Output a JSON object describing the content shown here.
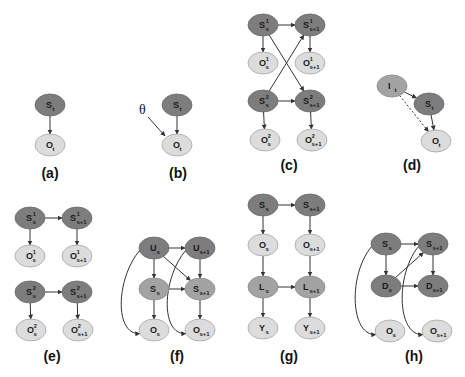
{
  "figure": {
    "panels": [
      {
        "id": "a",
        "label": "(a)",
        "nodes": [
          {
            "name": "S",
            "sub": "t",
            "sup": "",
            "shade": "dark",
            "x": 50,
            "y": 105
          },
          {
            "name": "O",
            "sub": "t",
            "sup": "",
            "shade": "light",
            "x": 50,
            "y": 145
          }
        ],
        "edges": [
          {
            "from": 0,
            "to": 1,
            "style": "solid"
          }
        ],
        "label_pos": [
          50,
          178
        ]
      },
      {
        "id": "b",
        "label": "(b)",
        "extra_symbol": "θ",
        "nodes": [
          {
            "name": "S",
            "sub": "t",
            "sup": "",
            "shade": "dark",
            "x": 177,
            "y": 105
          },
          {
            "name": "O",
            "sub": "t",
            "sup": "",
            "shade": "light",
            "x": 177,
            "y": 145
          }
        ],
        "edges": [
          {
            "from": 0,
            "to": 1,
            "style": "solid"
          }
        ],
        "label_pos": [
          178,
          178
        ]
      },
      {
        "id": "c",
        "label": "(c)",
        "nodes": [
          {
            "name": "S",
            "sub": "s",
            "sup": "1",
            "shade": "dark",
            "x": 263,
            "y": 25
          },
          {
            "name": "S",
            "sub": "s+1",
            "sup": "1",
            "shade": "dark",
            "x": 310,
            "y": 25
          },
          {
            "name": "O",
            "sub": "s",
            "sup": "1",
            "shade": "light",
            "x": 263,
            "y": 63
          },
          {
            "name": "O",
            "sub": "s+1",
            "sup": "1",
            "shade": "light",
            "x": 310,
            "y": 63
          },
          {
            "name": "S",
            "sub": "s",
            "sup": "2",
            "shade": "dark",
            "x": 263,
            "y": 101
          },
          {
            "name": "S",
            "sub": "s+1",
            "sup": "2",
            "shade": "dark",
            "x": 310,
            "y": 101
          },
          {
            "name": "O",
            "sub": "s",
            "sup": "2",
            "shade": "light",
            "x": 265,
            "y": 140
          },
          {
            "name": "O",
            "sub": "s+1",
            "sup": "2",
            "shade": "light",
            "x": 312,
            "y": 140
          }
        ],
        "edges": [
          {
            "from": 0,
            "to": 1,
            "style": "solid"
          },
          {
            "from": 0,
            "to": 2,
            "style": "solid"
          },
          {
            "from": 1,
            "to": 3,
            "style": "solid"
          },
          {
            "from": 0,
            "to": 5,
            "style": "solid"
          },
          {
            "from": 4,
            "to": 1,
            "style": "solid"
          },
          {
            "from": 4,
            "to": 5,
            "style": "solid"
          },
          {
            "from": 4,
            "to": 6,
            "style": "solid"
          },
          {
            "from": 5,
            "to": 7,
            "style": "solid"
          }
        ],
        "label_pos": [
          289,
          170
        ]
      },
      {
        "id": "d",
        "label": "(d)",
        "nodes": [
          {
            "name": "I",
            "sub": "t",
            "sup": "",
            "shade": "mid",
            "x": 392,
            "y": 86
          },
          {
            "name": "S",
            "sub": "t",
            "sup": "",
            "shade": "dark",
            "x": 429,
            "y": 104
          },
          {
            "name": "O",
            "sub": "t",
            "sup": "",
            "shade": "light",
            "x": 436,
            "y": 141
          }
        ],
        "edges": [
          {
            "from": 0,
            "to": 1,
            "style": "solid"
          },
          {
            "from": 1,
            "to": 2,
            "style": "solid"
          },
          {
            "from": 0,
            "to": 2,
            "style": "dashed"
          }
        ],
        "label_pos": [
          412,
          170
        ]
      },
      {
        "id": "e",
        "label": "(e)",
        "nodes": [
          {
            "name": "S",
            "sub": "s",
            "sup": "1",
            "shade": "dark",
            "x": 30,
            "y": 218
          },
          {
            "name": "S",
            "sub": "s+1",
            "sup": "1",
            "shade": "dark",
            "x": 77,
            "y": 218
          },
          {
            "name": "O",
            "sub": "s",
            "sup": "1",
            "shade": "light",
            "x": 30,
            "y": 256
          },
          {
            "name": "O",
            "sub": "s+1",
            "sup": "1",
            "shade": "light",
            "x": 77,
            "y": 256
          },
          {
            "name": "S",
            "sub": "s",
            "sup": "2",
            "shade": "dark",
            "x": 30,
            "y": 292
          },
          {
            "name": "S",
            "sub": "s+1",
            "sup": "2",
            "shade": "dark",
            "x": 77,
            "y": 292
          },
          {
            "name": "O",
            "sub": "s",
            "sup": "2",
            "shade": "light",
            "x": 31,
            "y": 330
          },
          {
            "name": "O",
            "sub": "s+1",
            "sup": "2",
            "shade": "light",
            "x": 78,
            "y": 330
          }
        ],
        "edges": [
          {
            "from": 0,
            "to": 1,
            "style": "solid"
          },
          {
            "from": 0,
            "to": 2,
            "style": "solid"
          },
          {
            "from": 1,
            "to": 3,
            "style": "solid"
          },
          {
            "from": 4,
            "to": 5,
            "style": "solid"
          },
          {
            "from": 4,
            "to": 6,
            "style": "solid"
          },
          {
            "from": 5,
            "to": 7,
            "style": "solid"
          }
        ],
        "label_pos": [
          52,
          361
        ]
      },
      {
        "id": "f",
        "label": "(f)",
        "nodes": [
          {
            "name": "U",
            "sub": "s",
            "sup": "",
            "shade": "dark",
            "x": 154,
            "y": 248
          },
          {
            "name": "U",
            "sub": "s+1",
            "sup": "",
            "shade": "dark",
            "x": 200,
            "y": 248
          },
          {
            "name": "S",
            "sub": "s",
            "sup": "",
            "shade": "mid",
            "x": 154,
            "y": 289
          },
          {
            "name": "S",
            "sub": "s+1",
            "sup": "",
            "shade": "mid",
            "x": 200,
            "y": 289
          },
          {
            "name": "O",
            "sub": "s",
            "sup": "",
            "shade": "light",
            "x": 154,
            "y": 330
          },
          {
            "name": "O",
            "sub": "s+1",
            "sup": "",
            "shade": "light",
            "x": 200,
            "y": 330
          }
        ],
        "edges": [
          {
            "from": 0,
            "to": 1,
            "style": "solid"
          },
          {
            "from": 0,
            "to": 2,
            "style": "solid"
          },
          {
            "from": 1,
            "to": 3,
            "style": "solid"
          },
          {
            "from": 0,
            "to": 3,
            "style": "solid"
          },
          {
            "from": 2,
            "to": 3,
            "style": "solid"
          },
          {
            "from": 2,
            "to": 4,
            "style": "solid"
          },
          {
            "from": 3,
            "to": 5,
            "style": "solid"
          },
          {
            "from": 0,
            "to": 4,
            "style": "curved-left"
          },
          {
            "from": 1,
            "to": 5,
            "style": "curved-left"
          }
        ],
        "label_pos": [
          177,
          361
        ]
      },
      {
        "id": "g",
        "label": "(g)",
        "nodes": [
          {
            "name": "S",
            "sub": "s",
            "sup": "",
            "shade": "dark",
            "x": 263,
            "y": 205
          },
          {
            "name": "S",
            "sub": "s+1",
            "sup": "",
            "shade": "dark",
            "x": 310,
            "y": 205
          },
          {
            "name": "O",
            "sub": "s",
            "sup": "",
            "shade": "light",
            "x": 263,
            "y": 245
          },
          {
            "name": "O",
            "sub": "s+1",
            "sup": "",
            "shade": "light",
            "x": 310,
            "y": 245
          },
          {
            "name": "L",
            "sub": "s",
            "sup": "",
            "shade": "mid",
            "x": 263,
            "y": 287
          },
          {
            "name": "L",
            "sub": "s+1",
            "sup": "",
            "shade": "mid",
            "x": 310,
            "y": 287
          },
          {
            "name": "Y",
            "sub": "s",
            "sup": "",
            "shade": "light",
            "x": 263,
            "y": 328
          },
          {
            "name": "Y",
            "sub": "s+1",
            "sup": "",
            "shade": "light",
            "x": 310,
            "y": 328
          }
        ],
        "edges": [
          {
            "from": 0,
            "to": 1,
            "style": "solid"
          },
          {
            "from": 0,
            "to": 2,
            "style": "solid"
          },
          {
            "from": 1,
            "to": 3,
            "style": "solid"
          },
          {
            "from": 2,
            "to": 4,
            "style": "solid"
          },
          {
            "from": 3,
            "to": 5,
            "style": "solid"
          },
          {
            "from": 4,
            "to": 5,
            "style": "solid"
          },
          {
            "from": 4,
            "to": 6,
            "style": "solid"
          },
          {
            "from": 5,
            "to": 7,
            "style": "solid"
          }
        ],
        "label_pos": [
          289,
          361
        ]
      },
      {
        "id": "h",
        "label": "(h)",
        "nodes": [
          {
            "name": "S",
            "sub": "s",
            "sup": "",
            "shade": "dark",
            "x": 386,
            "y": 244
          },
          {
            "name": "S",
            "sub": "s+1",
            "sup": "",
            "shade": "dark",
            "x": 433,
            "y": 244
          },
          {
            "name": "D",
            "sub": "s",
            "sup": "",
            "shade": "dark",
            "x": 386,
            "y": 286
          },
          {
            "name": "D",
            "sub": "s+1",
            "sup": "",
            "shade": "dark",
            "x": 433,
            "y": 286
          },
          {
            "name": "O",
            "sub": "s",
            "sup": "",
            "shade": "light",
            "x": 390,
            "y": 331
          },
          {
            "name": "O",
            "sub": "s+1",
            "sup": "",
            "shade": "light",
            "x": 437,
            "y": 331
          }
        ],
        "edges": [
          {
            "from": 0,
            "to": 1,
            "style": "solid"
          },
          {
            "from": 0,
            "to": 2,
            "style": "solid"
          },
          {
            "from": 1,
            "to": 3,
            "style": "solid"
          },
          {
            "from": 2,
            "to": 3,
            "style": "solid"
          },
          {
            "from": 2,
            "to": 1,
            "style": "solid"
          },
          {
            "from": 0,
            "to": 4,
            "style": "curved-left"
          },
          {
            "from": 1,
            "to": 5,
            "style": "curved-left"
          }
        ],
        "label_pos": [
          414,
          361
        ]
      }
    ],
    "colors": {
      "dark": "#7d7d7d",
      "mid": "#a3a3a3",
      "light": "#dcdcdc",
      "edge": "#333333"
    }
  }
}
